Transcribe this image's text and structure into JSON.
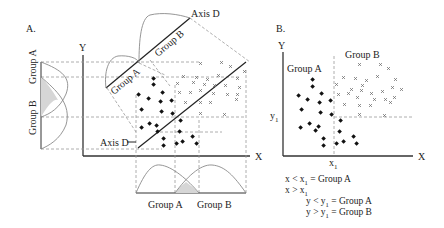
{
  "panel_a": {
    "label": "A.",
    "y_axis_label": "Y",
    "x_axis_label": "X",
    "axis_d_top_label": "Axis D",
    "axis_d_bottom_label": "Axis D",
    "proj_group_a": "Group A",
    "proj_group_b": "Group B",
    "left_group_a": "Group A",
    "left_group_b": "Group B",
    "bottom_group_a": "Group A",
    "bottom_group_b": "Group B"
  },
  "panel_b": {
    "label": "B.",
    "y_axis_label": "Y",
    "x_axis_label": "X",
    "group_a_label": "Group A",
    "group_b_label": "Group B",
    "y1_label": "y",
    "y1_sub": "1",
    "x1_label": "x",
    "x1_sub": "1"
  },
  "rules": [
    {
      "text": "x < x",
      "sub": "1",
      "rest": " = Group A"
    },
    {
      "text": "x > x",
      "sub": "1",
      "rest": ""
    },
    {
      "text": "y < y",
      "sub": "1",
      "rest": " = Group A"
    },
    {
      "text": "y > y",
      "sub": "1",
      "rest": " = Group B"
    }
  ],
  "legend": {
    "group_a_marker": "filled-diamond",
    "group_b_marker": "x-cross"
  }
}
